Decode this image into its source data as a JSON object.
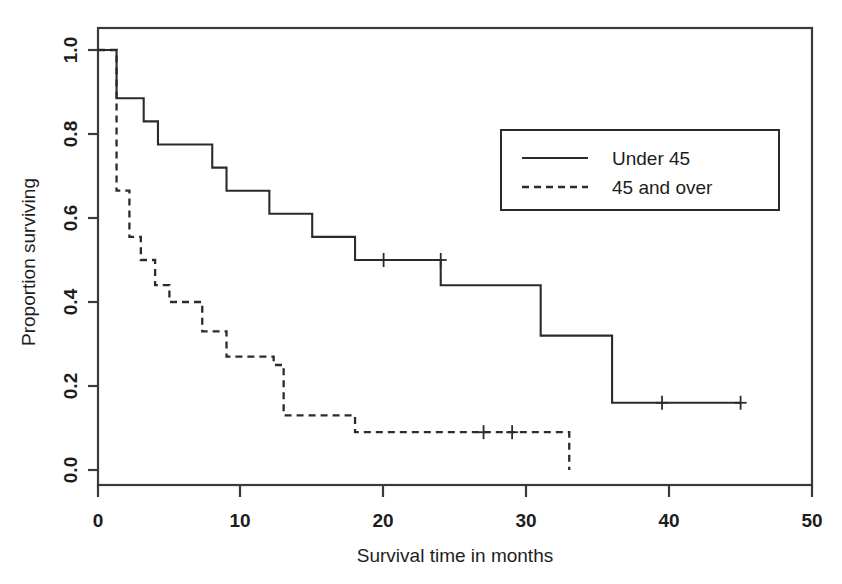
{
  "chart_data": {
    "type": "line",
    "chart_kind": "kaplan-meier-survival-curve",
    "title": "",
    "xlabel": "Survival time in months",
    "ylabel": "Proportion surviving",
    "xlim": [
      0,
      50
    ],
    "ylim": [
      0.0,
      1.0
    ],
    "xticks": [
      0,
      10,
      20,
      30,
      40,
      50
    ],
    "xtick_labels": [
      "0",
      "10",
      "20",
      "30",
      "40",
      "50"
    ],
    "yticks": [
      0.0,
      0.2,
      0.4,
      0.6,
      0.8,
      1.0
    ],
    "ytick_labels": [
      "0.0",
      "0.2",
      "0.4",
      "0.6",
      "0.8",
      "1.0"
    ],
    "grid": false,
    "legend_position": "upper right",
    "series": [
      {
        "name": "Under 45",
        "style": "solid",
        "color": "#2b2b2b",
        "steps": [
          {
            "t": 0.0,
            "s": 1.0
          },
          {
            "t": 1.3,
            "s": 0.885
          },
          {
            "t": 3.2,
            "s": 0.83
          },
          {
            "t": 4.2,
            "s": 0.775
          },
          {
            "t": 8.0,
            "s": 0.72
          },
          {
            "t": 9.0,
            "s": 0.665
          },
          {
            "t": 12.0,
            "s": 0.61
          },
          {
            "t": 15.0,
            "s": 0.555
          },
          {
            "t": 18.0,
            "s": 0.5
          },
          {
            "t": 24.0,
            "s": 0.44
          },
          {
            "t": 31.0,
            "s": 0.32
          },
          {
            "t": 36.0,
            "s": 0.16
          },
          {
            "t": 45.0,
            "s": 0.16
          }
        ],
        "censored": [
          {
            "t": 20.0,
            "s": 0.5
          },
          {
            "t": 24.0,
            "s": 0.5
          },
          {
            "t": 39.5,
            "s": 0.16
          },
          {
            "t": 45.0,
            "s": 0.16
          }
        ]
      },
      {
        "name": "45 and over",
        "style": "dashed",
        "color": "#2b2b2b",
        "steps": [
          {
            "t": 0.0,
            "s": 1.0
          },
          {
            "t": 1.3,
            "s": 0.665
          },
          {
            "t": 2.2,
            "s": 0.555
          },
          {
            "t": 3.0,
            "s": 0.5
          },
          {
            "t": 4.0,
            "s": 0.44
          },
          {
            "t": 5.0,
            "s": 0.4
          },
          {
            "t": 7.3,
            "s": 0.33
          },
          {
            "t": 9.0,
            "s": 0.27
          },
          {
            "t": 12.3,
            "s": 0.25
          },
          {
            "t": 13.0,
            "s": 0.13
          },
          {
            "t": 18.0,
            "s": 0.09
          },
          {
            "t": 33.0,
            "s": 0.09
          },
          {
            "t": 33.0,
            "s": 0.0
          }
        ],
        "censored": [
          {
            "t": 27.0,
            "s": 0.09
          },
          {
            "t": 29.0,
            "s": 0.09
          }
        ]
      }
    ]
  },
  "legend": {
    "entries": [
      {
        "label": "Under 45",
        "style": "solid"
      },
      {
        "label": "45 and over",
        "style": "dashed"
      }
    ]
  },
  "axes": {
    "x_title": "Survival time in months",
    "y_title": "Proportion surviving",
    "x_tick_labels": [
      "0",
      "10",
      "20",
      "30",
      "40",
      "50"
    ],
    "y_tick_labels": [
      "0.0",
      "0.2",
      "0.4",
      "0.6",
      "0.8",
      "1.0"
    ]
  }
}
